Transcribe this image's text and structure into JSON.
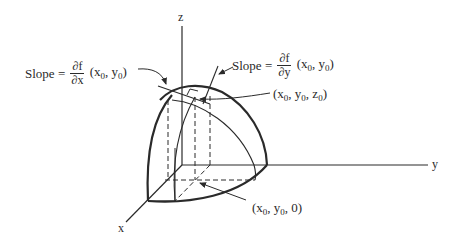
{
  "diagram": {
    "type": "3d-surface-partial-derivatives",
    "axes": {
      "x": {
        "label": "x"
      },
      "y": {
        "label": "y"
      },
      "z": {
        "label": "z"
      }
    },
    "annotations": {
      "slope_x": {
        "word": "Slope",
        "equals": "=",
        "numerator": "∂f",
        "denominator": "∂x",
        "args_open": "(x",
        "args_sub1": "0",
        "args_mid": ", y",
        "args_sub2": "0",
        "args_close": ")"
      },
      "slope_y": {
        "word": "Slope",
        "equals": "=",
        "numerator": "∂f",
        "denominator": "∂y",
        "args_open": "(x",
        "args_sub1": "0",
        "args_mid": ", y",
        "args_sub2": "0",
        "args_close": ")"
      },
      "point_surface": {
        "p1": "(x",
        "s1": "0",
        "p2": ", y",
        "s2": "0",
        "p3": ", z",
        "s3": "0",
        "p4": ")"
      },
      "point_base": {
        "p1": "(x",
        "s1": "0",
        "p2": ", y",
        "s2": "0",
        "p3": ", 0)"
      }
    },
    "colors": {
      "ink": "#2a2a2a",
      "background": "#ffffff"
    }
  }
}
